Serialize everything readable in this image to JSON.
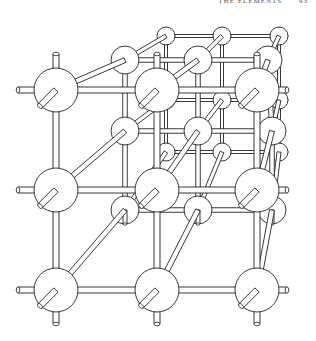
{
  "page": {
    "running_head": "THE ELEMENTS",
    "page_number": "93"
  },
  "figure": {
    "layers": [
      {
        "name": "back",
        "radius": 9,
        "positions": [
          [
            166,
            36
          ],
          [
            222,
            36
          ],
          [
            279,
            36
          ],
          [
            166,
            100
          ],
          [
            222,
            100
          ],
          [
            279,
            100
          ],
          [
            166,
            152
          ],
          [
            222,
            152
          ],
          [
            279,
            152
          ]
        ]
      },
      {
        "name": "middle",
        "radius": 14,
        "positions": [
          [
            125,
            60
          ],
          [
            198,
            60
          ],
          [
            268,
            60
          ],
          [
            125,
            131
          ],
          [
            198,
            131
          ],
          [
            272,
            131
          ],
          [
            125,
            210
          ],
          [
            198,
            210
          ],
          [
            272,
            210
          ]
        ]
      },
      {
        "name": "front",
        "radius": 22,
        "positions": [
          [
            56,
            90
          ],
          [
            157,
            90
          ],
          [
            257,
            90
          ],
          [
            56,
            190
          ],
          [
            157,
            190
          ],
          [
            257,
            190
          ],
          [
            56,
            290
          ],
          [
            157,
            290
          ],
          [
            257,
            290
          ]
        ]
      }
    ]
  }
}
